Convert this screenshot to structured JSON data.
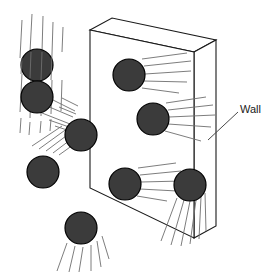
{
  "figure": {
    "background_color": "#ffffff",
    "width": 275,
    "height": 273
  },
  "colors": {
    "sphere_fill": "#3b3b3b",
    "sphere_stroke": "#000000",
    "wall_fill": "#ffffff",
    "wall_stroke": "#1a1a1a",
    "speed_line": "#6e6e6e",
    "label_text": "#1a1a1a",
    "leader_line": "#4a4a4a"
  },
  "labels": {
    "wall": "Wall"
  },
  "wall": {
    "name": "wall-slab",
    "front_face_points": "90,30 194,52 194,238 90,188",
    "top_face_points": "90,30 112,18 216,40 194,52",
    "side_face_points": "194,52 216,40 216,226 194,238",
    "leader_line": "M 238,112 L 208,140"
  },
  "particles": [
    {
      "name": "particle-1",
      "cx": 37,
      "cy": 65,
      "r": 16,
      "direction": "down"
    },
    {
      "name": "particle-2",
      "cx": 37,
      "cy": 97,
      "r": 16,
      "direction": "down"
    },
    {
      "name": "particle-3",
      "cx": 81,
      "cy": 135,
      "r": 16,
      "direction": "up-left"
    },
    {
      "name": "particle-4",
      "cx": 43,
      "cy": 172,
      "r": 16,
      "direction": "down-left"
    },
    {
      "name": "particle-5",
      "cx": 81,
      "cy": 228,
      "r": 16,
      "direction": "down"
    },
    {
      "name": "particle-6",
      "cx": 129,
      "cy": 75,
      "r": 16,
      "direction": "left"
    },
    {
      "name": "particle-7",
      "cx": 153,
      "cy": 119,
      "r": 16,
      "direction": "left"
    },
    {
      "name": "particle-8",
      "cx": 125,
      "cy": 184,
      "r": 16,
      "direction": "left"
    },
    {
      "name": "particle-9",
      "cx": 190,
      "cy": 185,
      "r": 16,
      "direction": "down-left"
    }
  ],
  "speed_lines": {
    "group_1_down": [
      "M 22,20 L 20,58",
      "M 22,74 L 20,112",
      "M 22,118 L 21,132",
      "M 32,14 L 30,52",
      "M 32,78 L 30,118",
      "M 31,122 L 30,134",
      "M 42,16 L 41,52",
      "M 42,80 L 41,116",
      "M 41,120 L 40,132",
      "M 52,22 L 51,54",
      "M 52,80 L 51,114",
      "M 51,118 L 50,130",
      "M 62,26 L 61,52",
      "M 62,80 L 61,112"
    ],
    "group_3_upleft": [
      "M 40,112 L 70,123",
      "M 44,104 L 72,116",
      "M 50,98 L 74,110",
      "M 56,112 L 72,118",
      "M 60,104 L 74,112",
      "M 46,118 L 68,126",
      "M 52,124 L 68,130"
    ],
    "group_4_downleft": [
      "M 33,145 L 62,126",
      "M 40,148 L 68,128",
      "M 47,150 L 74,130",
      "M 54,152 L 78,134",
      "M 60,154 L 80,140"
    ],
    "group_5_down": [
      "M 68,243 L 58,270",
      "M 76,246 L 70,272",
      "M 84,246 L 80,272",
      "M 92,244 L 92,270",
      "M 98,240 L 102,266",
      "M 103,235 L 110,258"
    ],
    "group_6_left": [
      "M 143,60 L 186,54",
      "M 145,66 L 190,62",
      "M 145,74 L 190,72",
      "M 145,81 L 186,82",
      "M 144,87 L 178,92"
    ],
    "group_7_left": [
      "M 166,104 L 205,98",
      "M 168,110 L 212,106",
      "M 168,117 L 214,116",
      "M 168,124 L 210,128",
      "M 165,130 L 200,140"
    ],
    "group_8_left": [
      "M 139,169 L 175,164",
      "M 141,175 L 180,172",
      "M 141,182 L 181,182",
      "M 140,189 L 176,192",
      "M 137,195 L 166,200"
    ],
    "group_9_downleft": [
      "M 178,198 L 162,240",
      "M 184,200 L 172,244",
      "M 190,201 L 181,246",
      "M 196,200 L 190,244",
      "M 201,198 L 199,240",
      "M 205,194 L 206,232"
    ]
  }
}
